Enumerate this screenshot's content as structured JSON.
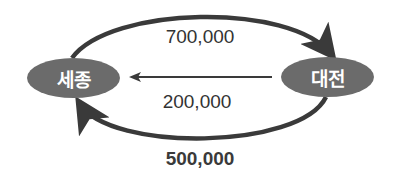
{
  "diagram": {
    "type": "flow-diagram",
    "colors": {
      "node_fill": "#6b6b6b",
      "node_text": "#ffffff",
      "arrow": "#3a3a3a",
      "label_text": "#333333"
    },
    "nodes": [
      {
        "id": "sejong",
        "label": "세종"
      },
      {
        "id": "daejeon",
        "label": "대전"
      }
    ],
    "flows": [
      {
        "from": "세종",
        "to": "대전",
        "path": "top-arc",
        "value": "700,000"
      },
      {
        "from": "대전",
        "to": "세종",
        "path": "straight-middle",
        "value": "200,000"
      },
      {
        "from": "대전",
        "to": "세종",
        "path": "bottom-arc",
        "value": "500,000"
      }
    ]
  }
}
